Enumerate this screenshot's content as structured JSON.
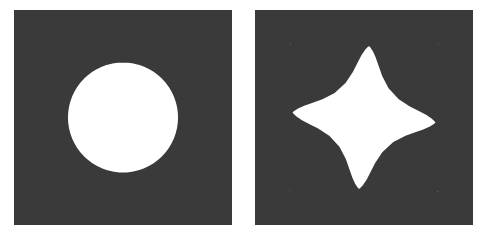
{
  "figure": {
    "title": "",
    "background_color": "#ffffff",
    "line_color": "#1a1a1a",
    "width": 488,
    "height": 242
  },
  "panels": [
    {
      "name": "undeformed-mesh",
      "label": "",
      "x": 14,
      "y": 10,
      "width": 218,
      "height": 215,
      "domain": "square-with-circular-hole",
      "square_side": 2.0,
      "hole_radius": 0.82,
      "hole_center": [
        0.0,
        0.0
      ],
      "radial_divisions": 8,
      "circumferential_divisions_per_side": 16,
      "element_type": "triangle",
      "deformation": {
        "mode": "none",
        "twist_amplitude": 0.0,
        "lobes": 0,
        "lobe_amplitude": 0.0
      }
    },
    {
      "name": "deformed-mesh",
      "label": "",
      "x": 255,
      "y": 10,
      "width": 218,
      "height": 215,
      "domain": "square-with-circular-hole",
      "square_side": 2.0,
      "hole_radius": 0.82,
      "hole_center": [
        0.0,
        0.0
      ],
      "radial_divisions": 8,
      "circumferential_divisions_per_side": 16,
      "element_type": "triangle",
      "deformation": {
        "mode": "twist-and-lobe",
        "twist_amplitude": 0.62,
        "lobes": 4,
        "lobe_amplitude": 0.2,
        "lobe_phase": 0.55
      }
    }
  ],
  "chart_data": {
    "type": "diagram",
    "subtype": "finite-element-mesh",
    "title": "",
    "panel_count": 2,
    "panel_names": [
      "undeformed-mesh",
      "deformed-mesh"
    ],
    "legend": [],
    "annotations": [],
    "grid": false
  }
}
